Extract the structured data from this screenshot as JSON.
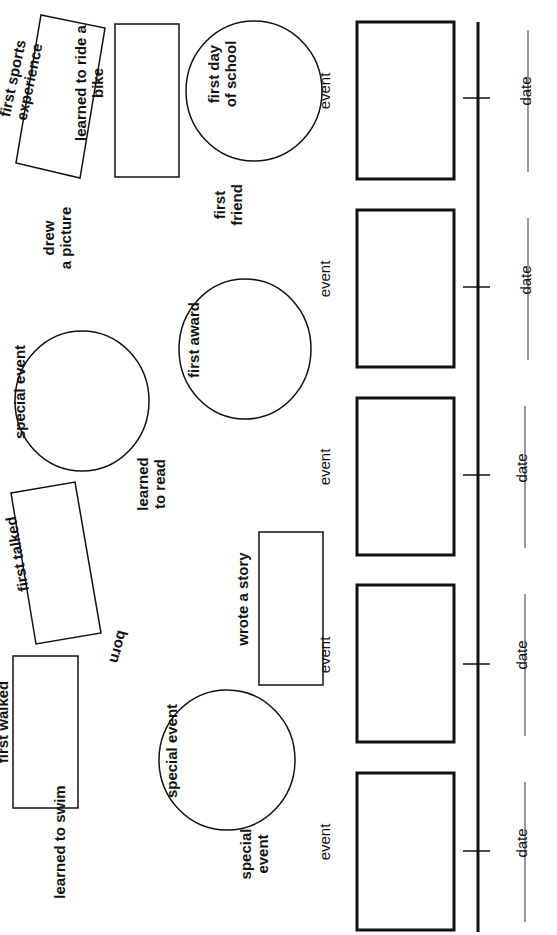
{
  "worksheet": {
    "orientation": "rotated-90-ccw",
    "colors": {
      "ink": "#111111",
      "paper": "#ffffff",
      "date_line": "#555555"
    }
  },
  "word_bank": {
    "shapes": [
      {
        "id": "first-sports-experience",
        "shape": "rotated-rectangle",
        "lines": [
          "first sports",
          "experience"
        ]
      },
      {
        "id": "learned-to-ride-a-bike",
        "shape": "rectangle",
        "lines": [
          "learned to ride a",
          "bike"
        ]
      },
      {
        "id": "first-day-of-school",
        "shape": "circle",
        "lines": [
          "first day",
          "of school"
        ]
      },
      {
        "id": "special-event-top",
        "shape": "circle",
        "lines": [
          "special event"
        ]
      },
      {
        "id": "first-award",
        "shape": "circle",
        "lines": [
          "first award"
        ]
      },
      {
        "id": "first-talked",
        "shape": "rotated-rectangle",
        "lines": [
          "first talked"
        ]
      },
      {
        "id": "wrote-a-story",
        "shape": "rectangle",
        "lines": [
          "wrote a story"
        ]
      },
      {
        "id": "first-walked",
        "shape": "rectangle",
        "lines": [
          "first walked"
        ]
      },
      {
        "id": "special-event-bottom",
        "shape": "circle",
        "lines": [
          "special event"
        ]
      }
    ],
    "free_text": [
      {
        "id": "drew-a-picture",
        "lines": [
          "drew",
          "a picture"
        ]
      },
      {
        "id": "first-friend",
        "lines": [
          "first",
          "friend"
        ]
      },
      {
        "id": "learned-to-read",
        "lines": [
          "learned",
          "to read"
        ]
      },
      {
        "id": "born",
        "lines": [
          "born"
        ]
      },
      {
        "id": "learned-to-swim",
        "lines": [
          "learned to swim"
        ]
      },
      {
        "id": "special-event-free",
        "lines": [
          "special",
          "event"
        ]
      }
    ]
  },
  "timeline": {
    "slots": [
      {
        "event_label": "event",
        "date_label": "date"
      },
      {
        "event_label": "event",
        "date_label": "date"
      },
      {
        "event_label": "event",
        "date_label": "date"
      },
      {
        "event_label": "event",
        "date_label": "date"
      },
      {
        "event_label": "event",
        "date_label": "date"
      }
    ]
  }
}
